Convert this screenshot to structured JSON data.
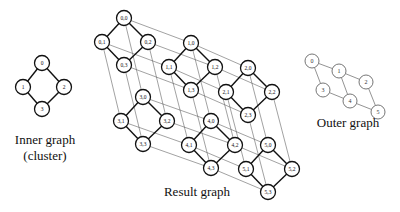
{
  "inner_graph": {
    "caption_line1": "Inner graph",
    "caption_line2": "(cluster)",
    "nodes": [
      {
        "id": "0",
        "x": 42,
        "y": 63
      },
      {
        "id": "1",
        "x": 23,
        "y": 87
      },
      {
        "id": "2",
        "x": 64,
        "y": 87
      },
      {
        "id": "3",
        "x": 42,
        "y": 109
      }
    ],
    "edges": [
      [
        "0",
        "1"
      ],
      [
        "0",
        "2"
      ],
      [
        "1",
        "3"
      ],
      [
        "2",
        "3"
      ]
    ]
  },
  "outer_graph": {
    "caption": "Outer graph",
    "nodes": [
      {
        "id": "0",
        "x": 312,
        "y": 61
      },
      {
        "id": "1",
        "x": 339,
        "y": 71
      },
      {
        "id": "2",
        "x": 366,
        "y": 82
      },
      {
        "id": "3",
        "x": 323,
        "y": 90
      },
      {
        "id": "4",
        "x": 350,
        "y": 101
      },
      {
        "id": "5",
        "x": 378,
        "y": 112
      }
    ],
    "edges": [
      [
        "0",
        "1"
      ],
      [
        "1",
        "2"
      ],
      [
        "3",
        "4"
      ],
      [
        "4",
        "5"
      ],
      [
        "0",
        "3"
      ],
      [
        "1",
        "4"
      ],
      [
        "2",
        "5"
      ]
    ]
  },
  "result_graph": {
    "caption": "Result graph",
    "cluster_anchor_offsets": {
      "0": [
        0,
        0
      ],
      "1": [
        -22,
        24
      ],
      "2": [
        24,
        24
      ],
      "3": [
        0,
        47
      ]
    },
    "clusters": [
      {
        "outer": "0",
        "x": 124,
        "y": 18
      },
      {
        "outer": "1",
        "x": 191,
        "y": 43
      },
      {
        "outer": "2",
        "x": 248,
        "y": 68
      },
      {
        "outer": "3",
        "x": 143,
        "y": 97
      },
      {
        "outer": "4",
        "x": 211,
        "y": 121
      },
      {
        "outer": "5",
        "x": 268,
        "y": 145
      }
    ],
    "node_label_format": "{outer},{inner}"
  }
}
